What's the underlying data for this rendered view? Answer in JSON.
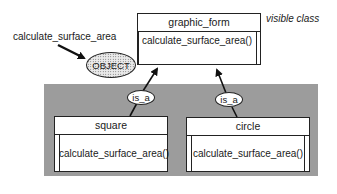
{
  "diagram": {
    "visible_class_label": "visible class",
    "message_label": "calculate_surface_area",
    "object_label": "OBJECT",
    "parent_class": {
      "name": "graphic_form",
      "method": "calculate_surface_area()"
    },
    "child_classes": [
      {
        "name": "square",
        "method": "calculate_surface_area()",
        "relation": "is_a"
      },
      {
        "name": "circle",
        "method": "calculate_surface_area()",
        "relation": "is_a"
      }
    ],
    "colors": {
      "background": "#ffffff",
      "hidden_region": "#9c9c9c",
      "stroke": "#222222"
    }
  }
}
